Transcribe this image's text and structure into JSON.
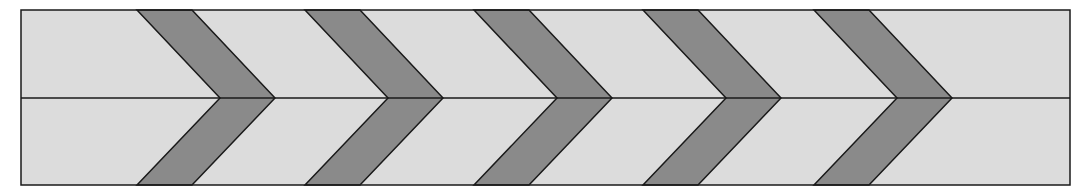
{
  "diagram": {
    "title": "",
    "frame": {
      "x": 21,
      "y": 10,
      "width": 1049,
      "height": 175,
      "midline_y": 98
    },
    "colors": {
      "background": "#ffffff",
      "light_fill": "#dcdcdc",
      "band_fill": "#8a8a8a",
      "stroke": "#1a1a1a"
    },
    "chevrons": [
      {
        "inner_top_x": 137,
        "outer_top_x": 192,
        "inner_tip_x": 220,
        "outer_tip_x": 275
      },
      {
        "inner_top_x": 305,
        "outer_top_x": 360,
        "inner_tip_x": 388,
        "outer_tip_x": 443
      },
      {
        "inner_top_x": 474,
        "outer_top_x": 529,
        "inner_tip_x": 557,
        "outer_tip_x": 612
      },
      {
        "inner_top_x": 643,
        "outer_top_x": 698,
        "inner_tip_x": 726,
        "outer_tip_x": 781
      },
      {
        "inner_top_x": 814,
        "outer_top_x": 869,
        "inner_tip_x": 897,
        "outer_tip_x": 952
      }
    ]
  }
}
